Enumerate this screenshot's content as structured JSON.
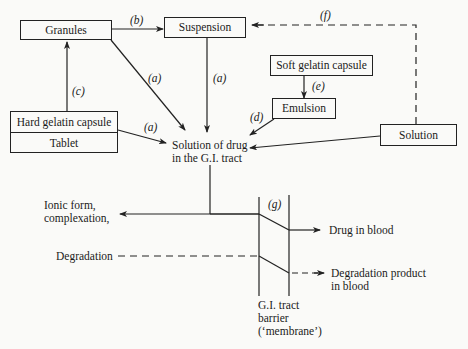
{
  "nodes": {
    "granules": "Granules",
    "suspension": "Suspension",
    "soft_gelatin_capsule": "Soft gelatin capsule",
    "emulsion": "Emulsion",
    "hard_gelatin_capsule": "Hard gelatin capsule",
    "tablet": "Tablet",
    "solution": "Solution",
    "solution_gi_line1": "Solution of drug",
    "solution_gi_line2": "in the G.I. tract",
    "ionic_line1": "Ionic form,",
    "ionic_line2": "complexation,",
    "degradation": "Degradation",
    "drug_in_blood": "Drug in blood",
    "degradation_product_line1": "Degradation product",
    "degradation_product_line2": "in blood",
    "barrier_line1": "G.I. tract",
    "barrier_line2": "barrier",
    "barrier_line3": "(‘membrane’)"
  },
  "edge_labels": {
    "a1": "(a)",
    "a2": "(a)",
    "a3": "(a)",
    "b": "(b)",
    "c": "(c)",
    "d": "(d)",
    "e": "(e)",
    "f": "(f)",
    "g": "(g)"
  }
}
